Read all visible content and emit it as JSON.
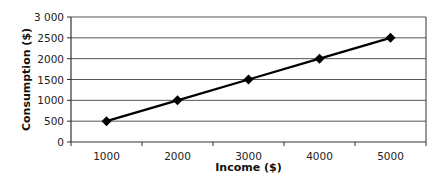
{
  "chart_data": {
    "type": "line",
    "title": "",
    "xlabel": "Income ($)",
    "ylabel": "Consumption ($)",
    "categories": [
      "1000",
      "2000",
      "3000",
      "4000",
      "5000"
    ],
    "x": [
      1000,
      2000,
      3000,
      4000,
      5000
    ],
    "series": [
      {
        "name": "Consumption",
        "values": [
          500,
          1000,
          1500,
          2000,
          2500
        ],
        "marker": "diamond",
        "color": "#000000"
      }
    ],
    "ylim": [
      0,
      3000
    ],
    "yticks": [
      "0",
      "500",
      "1000",
      "1500",
      "2000",
      "2500",
      "3000"
    ],
    "grid": true,
    "legend": "none"
  }
}
